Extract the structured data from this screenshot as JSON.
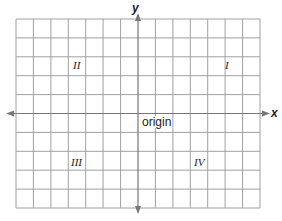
{
  "diagram": {
    "type": "coordinate-plane",
    "grid": {
      "columns": 14,
      "rows": 10,
      "line_color": "#9a9a9a",
      "axis_color": "#8a8a8a"
    },
    "axes": {
      "x_label": "x",
      "y_label": "y",
      "origin_label": "origin"
    },
    "quadrants": [
      {
        "id": "I",
        "label": "I"
      },
      {
        "id": "II",
        "label": "II"
      },
      {
        "id": "III",
        "label": "III"
      },
      {
        "id": "IV",
        "label": "IV"
      }
    ]
  }
}
